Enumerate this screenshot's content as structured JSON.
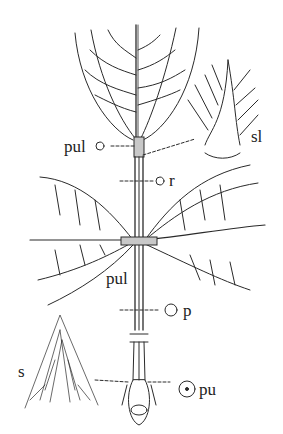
{
  "figure": {
    "colors": {
      "line": "#2a2a2a",
      "background": "#ffffff"
    },
    "labels": {
      "pulvinule_top": "pul",
      "rachis": "r",
      "stipel": "sl",
      "pulvinule_mid": "pul",
      "petiole": "p",
      "stipule": "s",
      "pulvinus": "pu"
    }
  }
}
